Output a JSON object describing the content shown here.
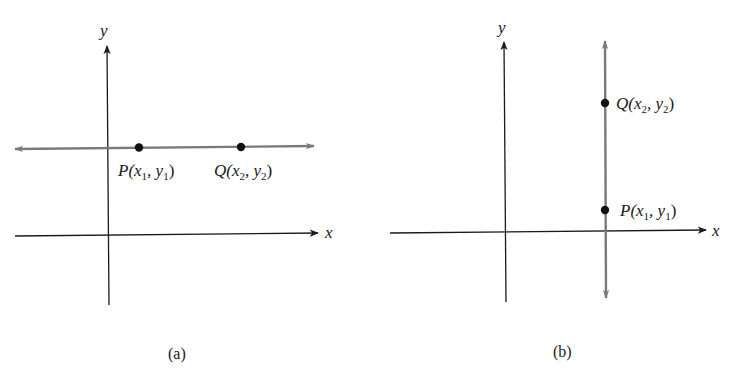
{
  "colors": {
    "axis": "#1a1a1a",
    "line": "#7a7a7a",
    "point": "#111111",
    "background": "#ffffff"
  },
  "panels": [
    {
      "id": "a",
      "caption": "(a)",
      "x_axis_label": "x",
      "y_axis_label": "y",
      "line_type": "horizontal",
      "points": [
        {
          "name": "P",
          "label_main": "P(x",
          "sub1": "1",
          "mid": ", y",
          "sub2": "1",
          "end": ")"
        },
        {
          "name": "Q",
          "label_main": "Q(x",
          "sub1": "2",
          "mid": ", y",
          "sub2": "2",
          "end": ")"
        }
      ]
    },
    {
      "id": "b",
      "caption": "(b)",
      "x_axis_label": "x",
      "y_axis_label": "y",
      "line_type": "vertical",
      "points": [
        {
          "name": "Q",
          "label_main": "Q(x",
          "sub1": "2",
          "mid": ", y",
          "sub2": "2",
          "end": ")"
        },
        {
          "name": "P",
          "label_main": "P(x",
          "sub1": "1",
          "mid": ", y",
          "sub2": "1",
          "end": ")"
        }
      ]
    }
  ]
}
